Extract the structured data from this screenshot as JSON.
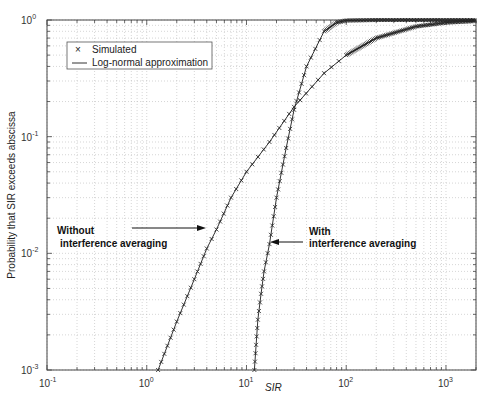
{
  "chart_data": {
    "type": "line",
    "title": "",
    "xlabel": "SIR",
    "ylabel": "Probability that SIR exceeds abscissa",
    "xscale": "log",
    "yscale": "log",
    "xlim": [
      0.1,
      2000
    ],
    "ylim": [
      0.001,
      1
    ],
    "grid": true,
    "legend": {
      "position": "upper left",
      "entries": [
        {
          "marker": "x",
          "label": "Simulated"
        },
        {
          "marker": "line",
          "label": "Log-normal approximation"
        }
      ]
    },
    "x_ticks": [
      "10^-1",
      "10^0",
      "10^1",
      "10^2",
      "10^3"
    ],
    "y_ticks": [
      "10^-3",
      "10^-2",
      "10^-1",
      "10^0"
    ],
    "series": [
      {
        "name": "Without interference averaging",
        "x": [
          1.3,
          2,
          3,
          4,
          5,
          7,
          10,
          17,
          30,
          60,
          100,
          200,
          500,
          1000,
          2000
        ],
        "y": [
          0.001,
          0.0026,
          0.006,
          0.011,
          0.016,
          0.03,
          0.05,
          0.09,
          0.18,
          0.35,
          0.5,
          0.7,
          0.88,
          0.95,
          0.98
        ]
      },
      {
        "name": "With interference averaging",
        "x": [
          12,
          13,
          14,
          15,
          17,
          20,
          25,
          30,
          40,
          60,
          80,
          100,
          200,
          2000
        ],
        "y": [
          0.001,
          0.0027,
          0.0045,
          0.007,
          0.012,
          0.03,
          0.08,
          0.17,
          0.4,
          0.8,
          0.95,
          0.99,
          1.0,
          1.0
        ]
      }
    ],
    "annotations": [
      {
        "text_lines": [
          "Without",
          "interference averaging"
        ],
        "arrow_to": [
          5,
          0.016
        ]
      },
      {
        "text_lines": [
          "With",
          "interference averaging"
        ],
        "arrow_to": [
          15,
          0.012
        ]
      }
    ]
  }
}
